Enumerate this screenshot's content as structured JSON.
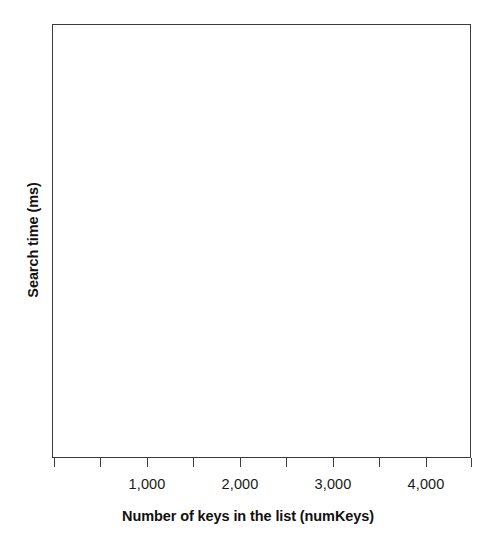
{
  "chart_data": {
    "type": "scatter",
    "title": "",
    "subtitle": "",
    "xlabel": "Number of keys in the list (numKeys)",
    "ylabel": "Search time (ms)",
    "xlim": [
      0,
      4500
    ],
    "ylim": [
      0,
      1
    ],
    "grid": false,
    "legend": null,
    "annotations": [],
    "x_tick_values": [
      500,
      1000,
      1500,
      2000,
      2500,
      3000,
      3500,
      4000,
      4500
    ],
    "x_tick_labels": [
      "",
      "1,000",
      "",
      "2,000",
      "",
      "3,000",
      "",
      "4,000",
      ""
    ],
    "y_tick_labels": [],
    "series": [],
    "x": [],
    "values": [],
    "note": "Blank plot frame with no data series drawn"
  },
  "axes": {
    "x": {
      "title": "Number of keys in the list (numKeys)",
      "ticks": [
        {
          "label": "",
          "x": 54
        },
        {
          "label": "",
          "x": 100
        },
        {
          "label": "1,000",
          "x": 147
        },
        {
          "label": "",
          "x": 193
        },
        {
          "label": "2,000",
          "x": 240
        },
        {
          "label": "",
          "x": 286
        },
        {
          "label": "3,000",
          "x": 333
        },
        {
          "label": "",
          "x": 379
        },
        {
          "label": "4,000",
          "x": 426
        },
        {
          "label": "",
          "x": 471
        }
      ],
      "labels": [
        {
          "text": "1,000",
          "x": 147
        },
        {
          "text": "2,000",
          "x": 240
        },
        {
          "text": "3,000",
          "x": 333
        },
        {
          "text": "4,000",
          "x": 426
        }
      ]
    },
    "y": {
      "title": "Search time (ms)",
      "ticks": [],
      "labels": []
    }
  },
  "style": {
    "frame_color": "#3c3c3c",
    "tick_color": "#3c3c3c",
    "text_color": "#1a1a1a",
    "title_color": "#111111",
    "plot_background": "#ffffff",
    "page_background": "#ffffff"
  }
}
